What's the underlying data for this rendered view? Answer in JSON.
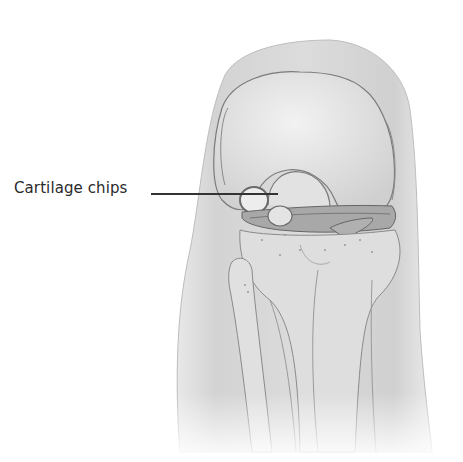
{
  "figure": {
    "labels": [
      {
        "text": "Cartilage chips",
        "points_to": "loose cartilage fragment between femur and tibia"
      }
    ]
  },
  "colors": {
    "background": "#ffffff",
    "skin": "#d9d9d9",
    "bone": "#e6e6e6",
    "outline": "#7a7a7a",
    "meniscus": "#9a9a9a",
    "text": "#2a2a2a"
  }
}
